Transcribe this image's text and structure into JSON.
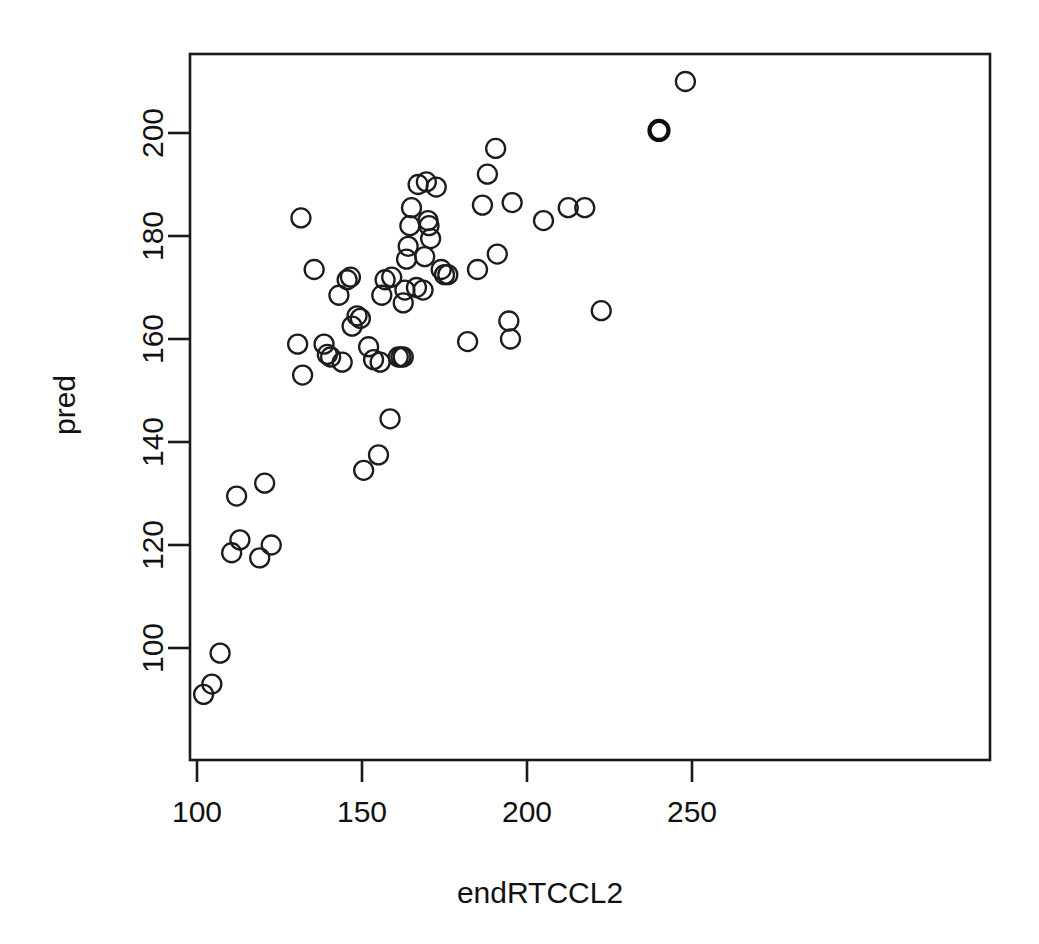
{
  "figure": {
    "kind": "scatterplot",
    "width": 1039,
    "height": 944,
    "background": "#ffffff",
    "foreground": "#111111"
  },
  "chart_data": {
    "type": "scatter",
    "title": "",
    "xlabel": "endRTCCL2",
    "ylabel": "pred",
    "xlim": [
      96,
      254
    ],
    "ylim": [
      85,
      214
    ],
    "xticks": [
      100,
      150,
      200,
      250
    ],
    "xtick_labels": [
      "100",
      "150",
      "200",
      "250"
    ],
    "yticks": [
      100,
      120,
      140,
      160,
      180,
      200
    ],
    "ytick_labels": [
      "100",
      "120",
      "140",
      "160",
      "180",
      "200"
    ],
    "grid": false,
    "legend": null,
    "marker": "open-circle",
    "marker_color": "#1c1c1c",
    "n_points": 67,
    "points": [
      {
        "x": 102.0,
        "y": 91.0
      },
      {
        "x": 104.5,
        "y": 93.0
      },
      {
        "x": 107.0,
        "y": 99.0
      },
      {
        "x": 110.5,
        "y": 118.5
      },
      {
        "x": 112.0,
        "y": 129.5
      },
      {
        "x": 113.0,
        "y": 121.0
      },
      {
        "x": 119.0,
        "y": 117.5
      },
      {
        "x": 120.5,
        "y": 132.0
      },
      {
        "x": 122.5,
        "y": 120.0
      },
      {
        "x": 130.5,
        "y": 159.0
      },
      {
        "x": 131.5,
        "y": 183.5
      },
      {
        "x": 132.0,
        "y": 153.0
      },
      {
        "x": 135.5,
        "y": 173.5
      },
      {
        "x": 138.5,
        "y": 159.0
      },
      {
        "x": 139.5,
        "y": 157.0
      },
      {
        "x": 140.5,
        "y": 156.5
      },
      {
        "x": 143.0,
        "y": 168.5
      },
      {
        "x": 144.0,
        "y": 155.5
      },
      {
        "x": 145.5,
        "y": 171.5
      },
      {
        "x": 146.5,
        "y": 172.0
      },
      {
        "x": 147.0,
        "y": 162.5
      },
      {
        "x": 148.5,
        "y": 164.5
      },
      {
        "x": 149.5,
        "y": 164.0
      },
      {
        "x": 150.5,
        "y": 134.5
      },
      {
        "x": 152.0,
        "y": 158.5
      },
      {
        "x": 153.5,
        "y": 156.0
      },
      {
        "x": 155.0,
        "y": 137.5
      },
      {
        "x": 155.5,
        "y": 155.5
      },
      {
        "x": 156.0,
        "y": 168.5
      },
      {
        "x": 157.0,
        "y": 171.5
      },
      {
        "x": 158.5,
        "y": 144.5
      },
      {
        "x": 159.0,
        "y": 172.0
      },
      {
        "x": 161.0,
        "y": 156.5
      },
      {
        "x": 161.8,
        "y": 156.5
      },
      {
        "x": 162.5,
        "y": 156.5
      },
      {
        "x": 162.5,
        "y": 167.0
      },
      {
        "x": 163.0,
        "y": 169.5
      },
      {
        "x": 163.5,
        "y": 175.5
      },
      {
        "x": 164.0,
        "y": 178.0
      },
      {
        "x": 164.5,
        "y": 182.0
      },
      {
        "x": 165.0,
        "y": 185.5
      },
      {
        "x": 166.5,
        "y": 170.0
      },
      {
        "x": 167.0,
        "y": 190.0
      },
      {
        "x": 168.5,
        "y": 169.5
      },
      {
        "x": 169.0,
        "y": 176.0
      },
      {
        "x": 169.5,
        "y": 190.5
      },
      {
        "x": 170.0,
        "y": 183.0
      },
      {
        "x": 170.3,
        "y": 182.0
      },
      {
        "x": 170.8,
        "y": 179.5
      },
      {
        "x": 172.5,
        "y": 189.5
      },
      {
        "x": 174.0,
        "y": 173.5
      },
      {
        "x": 175.0,
        "y": 172.5
      },
      {
        "x": 176.0,
        "y": 172.5
      },
      {
        "x": 182.0,
        "y": 159.5
      },
      {
        "x": 185.0,
        "y": 173.5
      },
      {
        "x": 186.5,
        "y": 186.0
      },
      {
        "x": 188.0,
        "y": 192.0
      },
      {
        "x": 190.5,
        "y": 197.0
      },
      {
        "x": 191.0,
        "y": 176.5
      },
      {
        "x": 194.5,
        "y": 163.5
      },
      {
        "x": 195.0,
        "y": 160.0
      },
      {
        "x": 195.5,
        "y": 186.5
      },
      {
        "x": 205.0,
        "y": 183.0
      },
      {
        "x": 212.5,
        "y": 185.5
      },
      {
        "x": 217.5,
        "y": 185.5
      },
      {
        "x": 222.5,
        "y": 165.5
      },
      {
        "x": 240.0,
        "y": 200.5
      },
      {
        "x": 248.0,
        "y": 210.0
      }
    ],
    "emphasized_point_index": 66
  }
}
